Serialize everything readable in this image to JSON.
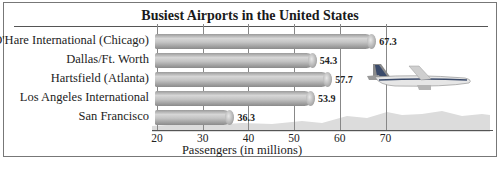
{
  "chart_data": {
    "type": "bar",
    "orientation": "horizontal",
    "title": "Busiest Airports in the United States",
    "xlabel": "Passengers (in millions)",
    "ylabel": "",
    "categories": [
      "O'Hare International (Chicago)",
      "Dallas/Ft. Worth",
      "Hartsfield (Atlanta)",
      "Los Angeles International",
      "San Francisco"
    ],
    "values": [
      67.3,
      54.3,
      57.7,
      53.9,
      36.3
    ],
    "value_labels": [
      "67.3",
      "54.3",
      "57.7",
      "53.9",
      "36.3"
    ],
    "xlim": [
      20,
      80
    ],
    "xticks": [
      20,
      30,
      40,
      50,
      60,
      70
    ],
    "xtick_labels": [
      "20",
      "30",
      "40",
      "50",
      "60",
      "70"
    ],
    "grid": true,
    "legend": null,
    "decoration": "airplane-over-mountains illustration"
  },
  "colors": {
    "bar": "#b8b8b8",
    "gridline": "#888888",
    "text": "#222222"
  }
}
